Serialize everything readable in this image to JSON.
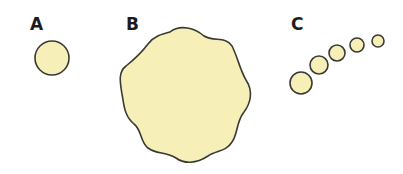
{
  "figure": {
    "panels": [
      {
        "id": "A",
        "label": "A",
        "description": "single small circle"
      },
      {
        "id": "B",
        "label": "B",
        "description": "large irregular wavy blob"
      },
      {
        "id": "C",
        "label": "C",
        "description": "chain of five circles decreasing in size"
      }
    ],
    "colors": {
      "fill": "#f6efb8",
      "stroke": "#3a3a34",
      "background": "#ffffff"
    }
  }
}
